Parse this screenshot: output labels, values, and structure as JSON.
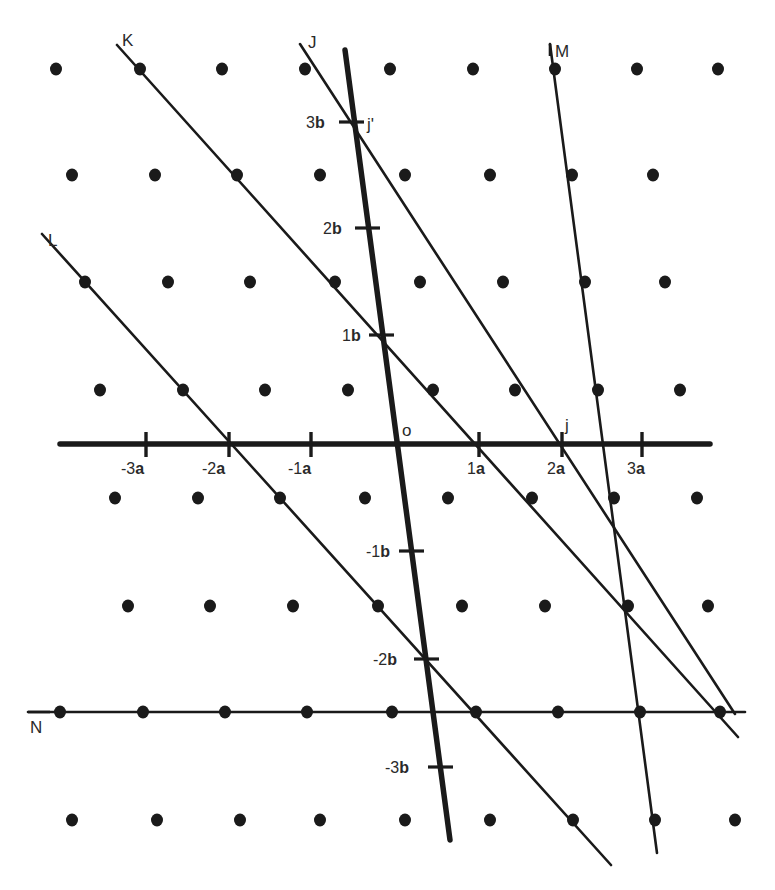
{
  "diagram": {
    "colors": {
      "ink": "#1a1a1a",
      "background": "#ffffff"
    },
    "lattice_points": [
      [
        56,
        69
      ],
      [
        140,
        69
      ],
      [
        222,
        69
      ],
      [
        305,
        69
      ],
      [
        390,
        69
      ],
      [
        473,
        69
      ],
      [
        555,
        69
      ],
      [
        637,
        69
      ],
      [
        718,
        69
      ],
      [
        72,
        175
      ],
      [
        155,
        175
      ],
      [
        237,
        175
      ],
      [
        320,
        175
      ],
      [
        405,
        175
      ],
      [
        490,
        175
      ],
      [
        572,
        175
      ],
      [
        653,
        175
      ],
      [
        85,
        282
      ],
      [
        168,
        282
      ],
      [
        250,
        282
      ],
      [
        335,
        282
      ],
      [
        420,
        282
      ],
      [
        503,
        282
      ],
      [
        585,
        282
      ],
      [
        665,
        282
      ],
      [
        100,
        390
      ],
      [
        183,
        390
      ],
      [
        265,
        390
      ],
      [
        348,
        390
      ],
      [
        433,
        390
      ],
      [
        515,
        390
      ],
      [
        598,
        390
      ],
      [
        680,
        390
      ],
      [
        115,
        498
      ],
      [
        198,
        498
      ],
      [
        280,
        498
      ],
      [
        365,
        498
      ],
      [
        448,
        498
      ],
      [
        532,
        498
      ],
      [
        614,
        498
      ],
      [
        697,
        498
      ],
      [
        128,
        606
      ],
      [
        210,
        606
      ],
      [
        293,
        606
      ],
      [
        378,
        606
      ],
      [
        462,
        606
      ],
      [
        545,
        606
      ],
      [
        628,
        606
      ],
      [
        708,
        606
      ],
      [
        60,
        712
      ],
      [
        143,
        712
      ],
      [
        225,
        712
      ],
      [
        307,
        712
      ],
      [
        392,
        712
      ],
      [
        476,
        712
      ],
      [
        558,
        712
      ],
      [
        640,
        712
      ],
      [
        720,
        712
      ],
      [
        72,
        820
      ],
      [
        157,
        820
      ],
      [
        240,
        820
      ],
      [
        320,
        820
      ],
      [
        405,
        820
      ],
      [
        490,
        820
      ],
      [
        573,
        820
      ],
      [
        655,
        820
      ],
      [
        735,
        820
      ]
    ],
    "a_axis": {
      "from": [
        60,
        444
      ],
      "to": [
        710,
        444
      ],
      "ticks": [
        {
          "x": 146,
          "num": "-3",
          "vec": "a"
        },
        {
          "x": 229,
          "num": "-2",
          "vec": "a"
        },
        {
          "x": 311,
          "num": "-1",
          "vec": "a"
        },
        {
          "x": 479,
          "num": "1",
          "vec": "a"
        },
        {
          "x": 562,
          "num": "2",
          "vec": "a"
        },
        {
          "x": 642,
          "num": "3",
          "vec": "a"
        }
      ]
    },
    "b_axis": {
      "from": [
        345,
        50
      ],
      "to": [
        450,
        840
      ],
      "ticks": [
        {
          "x": 352,
          "y": 122,
          "num": "3",
          "vec": "b"
        },
        {
          "x": 367,
          "y": 227,
          "num": "2",
          "vec": "b"
        },
        {
          "x": 380,
          "y": 335,
          "num": "1",
          "vec": "b"
        },
        {
          "x": 413,
          "y": 551,
          "num": "-1",
          "vec": "b"
        },
        {
          "x": 426,
          "y": 658,
          "num": "-2",
          "vec": "b"
        },
        {
          "x": 440,
          "y": 767,
          "num": "-3",
          "vec": "b"
        }
      ]
    },
    "origin": {
      "label": "o",
      "x": 397,
      "y": 444
    },
    "points": [
      {
        "label": "j",
        "x": 562,
        "y": 444
      },
      {
        "label": "j'",
        "x": 352,
        "y": 122
      }
    ],
    "lattice_lines": [
      {
        "label": "K",
        "from": [
          117,
          45
        ],
        "to": [
          738,
          737
        ],
        "label_pos": [
          122,
          44
        ]
      },
      {
        "label": "J",
        "from": [
          300,
          44
        ],
        "to": [
          735,
          714
        ],
        "label_pos": [
          310,
          44
        ]
      },
      {
        "label": "L",
        "from": [
          42,
          234
        ],
        "to": [
          611,
          865
        ],
        "label_pos": [
          48,
          244
        ]
      },
      {
        "label": "M",
        "from": [
          550,
          44
        ],
        "to": [
          657,
          853
        ],
        "label_pos": [
          555,
          55
        ]
      },
      {
        "label": "N",
        "from": [
          28,
          712
        ],
        "to": [
          745,
          712
        ],
        "label_pos": [
          30,
          731
        ]
      }
    ],
    "labels": {
      "o": "o",
      "j": "j",
      "j_prime": "j'",
      "K": "K",
      "J": "J",
      "L": "L",
      "M": "M",
      "N": "N",
      "tick_a_m3_num": "-3",
      "tick_a_m2_num": "-2",
      "tick_a_m1_num": "-1",
      "tick_a_1_num": "1",
      "tick_a_2_num": "2",
      "tick_a_3_num": "3",
      "tick_b_3_num": "3",
      "tick_b_2_num": "2",
      "tick_b_1_num": "1",
      "tick_b_m1_num": "-1",
      "tick_b_m2_num": "-2",
      "tick_b_m3_num": "-3",
      "vec_a": "a",
      "vec_b": "b"
    }
  }
}
